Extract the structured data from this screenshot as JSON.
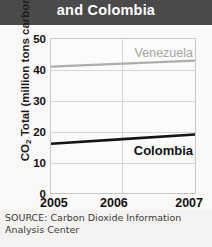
{
  "title": {
    "text": "and Colombia",
    "ghost_fragment": "",
    "bar_color": "#4a4a4a",
    "text_color": "#ffffff"
  },
  "source": {
    "line1": "SOURCE: Carbon Dioxide Information",
    "line2": "Analysis Center"
  },
  "chart_data": {
    "type": "line",
    "title": "and Colombia",
    "xlabel": "",
    "ylabel": "CO2 Total (million tons carbon)",
    "ylabel_prefix": "CO",
    "ylabel_sub": "2",
    "ylabel_suffix": " Total (million tons carbon)",
    "x": [
      "2005",
      "2006",
      "2007"
    ],
    "xlim": [
      2005,
      2007
    ],
    "ylim": [
      0,
      50
    ],
    "yticks": [
      50,
      40,
      30,
      20,
      10,
      0
    ],
    "xticks": [
      "2005",
      "2006",
      "2007"
    ],
    "grid": true,
    "legend": "inline-labels",
    "series": [
      {
        "name": "Venezuela",
        "values": [
          41,
          42,
          43
        ],
        "color": "#b0aeac",
        "label_color": "#a7a5a3",
        "line_width": 2.2
      },
      {
        "name": "Colombia",
        "values": [
          16,
          17.5,
          19
        ],
        "color": "#141414",
        "label_color": "#111111",
        "line_width": 2.6
      }
    ]
  }
}
